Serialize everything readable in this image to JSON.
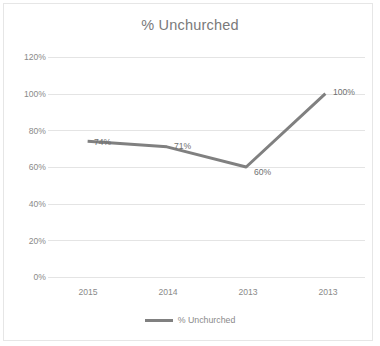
{
  "chart_data": {
    "type": "line",
    "title": "% Unchurched",
    "xlabel": "",
    "ylabel": "",
    "categories": [
      "2015",
      "2014",
      "2013",
      "2013"
    ],
    "series": [
      {
        "name": "% Unchurched",
        "values": [
          74,
          71,
          60,
          100
        ],
        "data_labels": [
          "74%",
          "71%",
          "60%",
          "100%"
        ],
        "color": "#808080"
      }
    ],
    "ylim": [
      0,
      120
    ],
    "ytick_values": [
      0,
      20,
      40,
      60,
      80,
      100,
      120
    ],
    "ytick_labels": [
      "0%",
      "20%",
      "40%",
      "60%",
      "80%",
      "100%",
      "120%"
    ],
    "grid": true,
    "legend": {
      "position": "bottom",
      "entries": [
        "% Unchurched"
      ]
    }
  },
  "style": {
    "line_color": "#808080",
    "grid_color": "#e4e4e4",
    "text_color": "#8a8a8a",
    "title_color": "#7a7a7a",
    "background": "#ffffff",
    "border_color": "#e6e6e6"
  }
}
